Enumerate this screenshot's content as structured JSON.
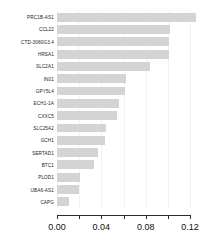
{
  "chart_data": {
    "type": "bar",
    "orientation": "horizontal",
    "title": "",
    "xlabel": "",
    "ylabel": "",
    "xlim": [
      0.0,
      0.13
    ],
    "grid": true,
    "legend": false,
    "bar_color": "#d4d4d4",
    "axis_color": "#2b2b2b",
    "categories": [
      "PRC1B-AS1",
      "CCL22",
      "CTD-3080G3.4",
      "HRSA1",
      "SLC2A1",
      "IN01",
      "GPY5L4",
      "ECH1-1A",
      "CXXC5",
      "SLC25A2",
      "GCH1",
      "SERTAD1",
      "BTC1",
      "PLOD1",
      "UBA6-AS1",
      "CAPG"
    ],
    "values": [
      0.125,
      0.102,
      0.101,
      0.101,
      0.084,
      0.062,
      0.061,
      0.056,
      0.054,
      0.044,
      0.043,
      0.037,
      0.033,
      0.021,
      0.02,
      0.011
    ],
    "x_ticks": [
      0.0,
      0.02,
      0.04,
      0.06,
      0.08,
      0.1,
      0.12
    ],
    "x_tick_labels": [
      "0.00",
      "",
      "0.04",
      "",
      "0.08",
      "",
      "0.12"
    ]
  }
}
